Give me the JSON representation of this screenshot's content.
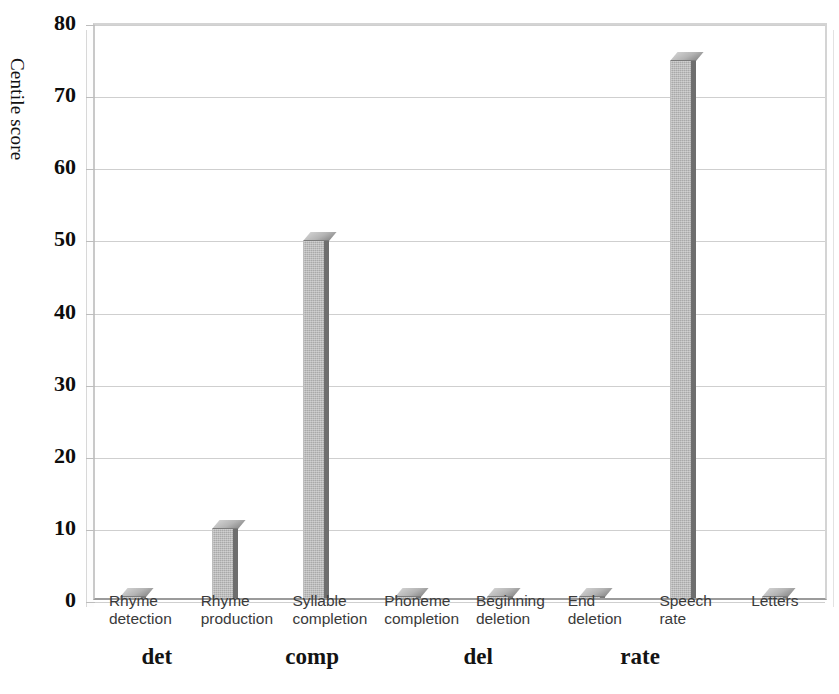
{
  "chart_data": {
    "type": "bar",
    "title": "",
    "xlabel": "",
    "ylabel": "Centile score",
    "ylim": [
      0,
      80
    ],
    "ytick_step": 10,
    "yticks": [
      0,
      10,
      20,
      30,
      40,
      50,
      60,
      70,
      80
    ],
    "grid": true,
    "legend": "none",
    "style": "3d-bar",
    "bar_color": "#a9a9a9",
    "bar_side_color": "#6e6e6e",
    "gridline_color": "#cfcfcf",
    "axis_color": "#9b9b9b",
    "categories": [
      "Rhyme detection",
      "Rhyme production",
      "Syllable completion",
      "Phoneme completion",
      "Beginning deletion",
      "End deletion",
      "Speech rate",
      "Letters"
    ],
    "category_lines": [
      [
        "Rhyme",
        "detection"
      ],
      [
        "Rhyme",
        "production"
      ],
      [
        "Syllable",
        "completion"
      ],
      [
        "Phoneme",
        "completion"
      ],
      [
        "Beginning",
        "deletion"
      ],
      [
        "End",
        "deletion"
      ],
      [
        "Speech",
        "rate"
      ],
      [
        "Letters",
        ""
      ]
    ],
    "values": [
      0,
      9.5,
      49.5,
      0,
      0,
      0,
      74.5,
      0
    ],
    "groups": [
      {
        "label": "det",
        "center_pct": 18.7
      },
      {
        "label": "comp",
        "center_pct": 37.2
      },
      {
        "label": "del",
        "center_pct": 57.0
      },
      {
        "label": "rate",
        "center_pct": 76.3
      }
    ]
  }
}
